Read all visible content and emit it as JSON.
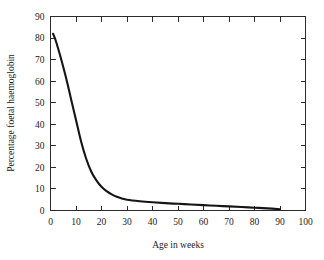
{
  "chart_data": {
    "type": "line",
    "title": "",
    "xlabel": "Age in weeks",
    "ylabel": "Percentage foetal haemoglobin",
    "xlim": [
      0,
      100
    ],
    "ylim": [
      0,
      90
    ],
    "xticks": [
      0,
      10,
      20,
      30,
      40,
      50,
      60,
      70,
      80,
      90,
      100
    ],
    "xtick_labels": [
      "0",
      "10",
      "20",
      "30",
      "40",
      "50",
      "60",
      "70",
      "80",
      "90",
      "100"
    ],
    "yticks": [
      0,
      10,
      20,
      30,
      40,
      50,
      60,
      70,
      80,
      90
    ],
    "ytick_labels": [
      "0",
      "10",
      "20",
      "30",
      "40",
      "50",
      "60",
      "70",
      "80",
      "90"
    ],
    "grid": false,
    "legend": null,
    "series": [
      {
        "name": "Percentage foetal haemoglobin",
        "color": "#151515",
        "x": [
          1,
          2,
          4,
          6,
          8,
          10,
          12,
          14,
          16,
          18,
          20,
          22,
          24,
          26,
          28,
          30,
          35,
          40,
          45,
          50,
          55,
          60,
          65,
          70,
          75,
          80,
          85,
          90
        ],
        "y": [
          82,
          79,
          71,
          62,
          52,
          42,
          32,
          24,
          18,
          14,
          11,
          9,
          7.5,
          6.4,
          5.6,
          5,
          4.3,
          3.8,
          3.4,
          3.1,
          2.8,
          2.5,
          2.2,
          1.9,
          1.6,
          1.3,
          1.0,
          0.6
        ]
      }
    ]
  },
  "axes": {
    "x_title": "Age in weeks",
    "y_title": "Percentage foetal haemoglobin"
  }
}
